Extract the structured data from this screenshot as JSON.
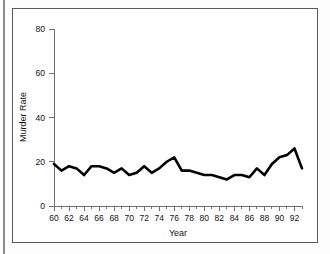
{
  "figure": {
    "border_color": "#5b5b5b",
    "background": "#ffffff"
  },
  "chart_data": {
    "type": "line",
    "title": "",
    "xlabel": "Year",
    "ylabel": "Murder Rate",
    "xlim": [
      60,
      93
    ],
    "ylim": [
      0,
      80
    ],
    "yticks": [
      0,
      20,
      40,
      60,
      80
    ],
    "ytick_labels": [
      "0",
      "20",
      "40",
      "60",
      "80"
    ],
    "xticks": [
      60,
      62,
      64,
      66,
      68,
      70,
      72,
      74,
      76,
      78,
      80,
      82,
      84,
      86,
      88,
      90,
      92
    ],
    "xtick_labels": [
      "60",
      "62",
      "64",
      "66",
      "68",
      "70",
      "72",
      "74",
      "76",
      "78",
      "80",
      "82",
      "84",
      "86",
      "88",
      "90",
      "92"
    ],
    "xticks_minor": [
      61,
      63,
      65,
      67,
      69,
      71,
      73,
      75,
      77,
      79,
      81,
      83,
      85,
      87,
      89,
      91,
      93
    ],
    "grid": false,
    "legend": false,
    "line_color": "#000000",
    "x": [
      60,
      61,
      62,
      63,
      64,
      65,
      66,
      67,
      68,
      69,
      70,
      71,
      72,
      73,
      74,
      75,
      76,
      77,
      78,
      79,
      80,
      81,
      82,
      83,
      84,
      85,
      86,
      87,
      88,
      89,
      90,
      91,
      92,
      93
    ],
    "values": [
      19,
      16,
      18,
      14,
      18,
      18,
      17,
      15,
      17,
      14,
      17,
      15,
      18,
      15,
      16,
      19,
      21,
      22,
      22,
      16,
      16,
      17,
      15,
      14,
      14,
      14,
      13,
      12,
      14,
      15,
      15,
      13,
      14,
      17
    ],
    "series": [
      {
        "name": "Murder Rate",
        "values": [
          19,
          16,
          18,
          14,
          18,
          18,
          17,
          15,
          17,
          14,
          17,
          15,
          18,
          15,
          16,
          19,
          21,
          22,
          22,
          16,
          16,
          17,
          15,
          14,
          14,
          14,
          13,
          12,
          14,
          15,
          15,
          13,
          14,
          17
        ]
      }
    ],
    "points": [
      {
        "year": 60,
        "rate": 19
      },
      {
        "year": 61,
        "rate": 16
      },
      {
        "year": 62,
        "rate": 18
      },
      {
        "year": 63,
        "rate": 17
      },
      {
        "year": 64,
        "rate": 14
      },
      {
        "year": 65,
        "rate": 18
      },
      {
        "year": 66,
        "rate": 18
      },
      {
        "year": 67,
        "rate": 17
      },
      {
        "year": 68,
        "rate": 15
      },
      {
        "year": 69,
        "rate": 17
      },
      {
        "year": 70,
        "rate": 14
      },
      {
        "year": 71,
        "rate": 15
      },
      {
        "year": 72,
        "rate": 18
      },
      {
        "year": 73,
        "rate": 15
      },
      {
        "year": 74,
        "rate": 17
      },
      {
        "year": 75,
        "rate": 20
      },
      {
        "year": 76,
        "rate": 22
      },
      {
        "year": 77,
        "rate": 16
      },
      {
        "year": 78,
        "rate": 16
      },
      {
        "year": 79,
        "rate": 15
      },
      {
        "year": 80,
        "rate": 14
      },
      {
        "year": 81,
        "rate": 14
      },
      {
        "year": 82,
        "rate": 13
      },
      {
        "year": 83,
        "rate": 12
      },
      {
        "year": 84,
        "rate": 14
      },
      {
        "year": 85,
        "rate": 14
      },
      {
        "year": 86,
        "rate": 13
      },
      {
        "year": 87,
        "rate": 17
      },
      {
        "year": 88,
        "rate": 14
      },
      {
        "year": 89,
        "rate": 19
      },
      {
        "year": 90,
        "rate": 22
      },
      {
        "year": 91,
        "rate": 23
      },
      {
        "year": 92,
        "rate": 26
      },
      {
        "year": 93,
        "rate": 17
      }
    ]
  }
}
